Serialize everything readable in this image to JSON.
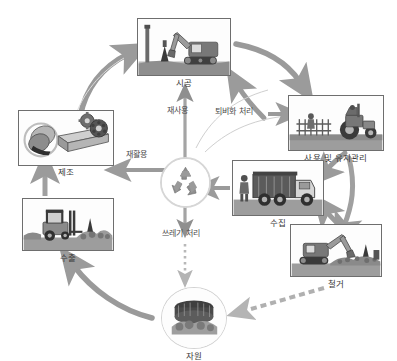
{
  "diagram": {
    "type": "cycle-flow-diagram",
    "center": {
      "name": "recycle-symbol",
      "icon": "recycle-icon",
      "label": ""
    },
    "nodes": [
      {
        "id": "construction",
        "label": "시공",
        "icon": "excavator-icon",
        "shape": "rect",
        "x": 137,
        "y": 18,
        "w": 94,
        "h": 58
      },
      {
        "id": "use-maintenance",
        "label": "사용 및 유지관리",
        "icon": "tractor-icon",
        "shape": "rect",
        "x": 288,
        "y": 95,
        "w": 96,
        "h": 56
      },
      {
        "id": "collection",
        "label": "수집",
        "icon": "garbage-truck-icon",
        "shape": "rect",
        "x": 232,
        "y": 160,
        "w": 92,
        "h": 56
      },
      {
        "id": "demolition",
        "label": "철거",
        "icon": "demolition-excavator-icon",
        "shape": "rect",
        "x": 290,
        "y": 224,
        "w": 92,
        "h": 53
      },
      {
        "id": "resource",
        "label": "자원",
        "icon": "steel-stack-icon",
        "shape": "circle",
        "x": 161,
        "y": 287,
        "w": 66,
        "h": 62
      },
      {
        "id": "export",
        "label": "수출",
        "icon": "forklift-icon",
        "shape": "rect",
        "x": 22,
        "y": 198,
        "w": 92,
        "h": 53
      },
      {
        "id": "manufacturing",
        "label": "제조",
        "icon": "steel-beam-gear-icon",
        "shape": "rect",
        "x": 18,
        "y": 110,
        "w": 96,
        "h": 56
      }
    ],
    "edge_labels": [
      {
        "id": "reuse",
        "text": "재사용",
        "x": 180,
        "y": 111
      },
      {
        "id": "recycle",
        "text": "재활용",
        "x": 125,
        "y": 149
      },
      {
        "id": "composting",
        "text": "퇴비화 처리",
        "x": 222,
        "y": 110
      },
      {
        "id": "waste",
        "text": "쓰레기 처리",
        "x": 170,
        "y": 232
      }
    ],
    "colors": {
      "arrow": "#8c8c8c",
      "arrow_light": "#a8a8a8",
      "text": "#3a3a3a",
      "border": "#6e6e6e",
      "ring": "#d2d2d2",
      "background": "#ffffff"
    }
  }
}
